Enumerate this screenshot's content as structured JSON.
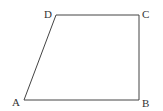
{
  "diagram": {
    "type": "trapezoid",
    "stroke_color": "#444444",
    "label_color": "#333333",
    "vertices": [
      {
        "name": "A",
        "x": 24,
        "y": 100,
        "label_x": 12,
        "label_y": 106
      },
      {
        "name": "B",
        "x": 139,
        "y": 100,
        "label_x": 142,
        "label_y": 107
      },
      {
        "name": "C",
        "x": 139,
        "y": 15,
        "label_x": 142,
        "label_y": 18
      },
      {
        "name": "D",
        "x": 56,
        "y": 15,
        "label_x": 44,
        "label_y": 18
      }
    ],
    "edges": [
      {
        "from": "A",
        "to": "B"
      },
      {
        "from": "B",
        "to": "C"
      },
      {
        "from": "C",
        "to": "D"
      },
      {
        "from": "D",
        "to": "A"
      }
    ]
  }
}
